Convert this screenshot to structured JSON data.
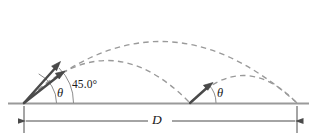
{
  "figure": {
    "name": "projectile-range-diagram",
    "width": 317,
    "height": 138,
    "background_color": "#ffffff"
  },
  "colors": {
    "ground_line": "#9a9a9a",
    "trajectory_dashed": "#9a9a9a",
    "vector_arrow": "#4a4a4a",
    "arc": "#8c8c8c",
    "dimension_line": "#4a4a4a",
    "text": "#1a1a1a"
  },
  "labels": {
    "angle_45": "45.0°",
    "theta_left": "θ",
    "theta_right": "θ",
    "distance": "D"
  },
  "geometry": {
    "ground_y": 103,
    "origin_left_x": 24,
    "second_launch_x": 190,
    "landing_x": 297,
    "dimension_y": 121,
    "dimension_left_x": 24,
    "dimension_right_x": 297
  },
  "elements": {
    "ground_line_name": "ground-line",
    "trajectory_high_name": "trajectory-45-degree",
    "trajectory_low_name": "trajectory-theta-first-stage",
    "trajectory_small_name": "trajectory-theta-second-stage",
    "arrow_steep_name": "velocity-vector-theta",
    "arrow_45_name": "velocity-vector-45",
    "arrow_right_name": "velocity-vector-theta-second",
    "arc_theta_left_name": "angle-arc-theta-left",
    "arc_45_name": "angle-arc-45",
    "arc_theta_right_name": "angle-arc-theta-right",
    "dimension_name": "range-dimension-line"
  }
}
